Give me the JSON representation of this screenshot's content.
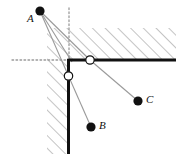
{
  "figure": {
    "kind": "optics-reflection-diagram",
    "width": 176,
    "height": 154,
    "background": "#ffffff"
  },
  "colors": {
    "wall": "#111111",
    "hatch": "#8a8a8a",
    "ray": "#9a9a9a",
    "dotted": "#9a9a9a",
    "point_fill": "#111111",
    "circle_fill": "#ffffff",
    "circle_stroke": "#111111",
    "label": "#111111"
  },
  "geometry": {
    "corner": {
      "x": 68.5,
      "y": 60
    },
    "horizontal_wall": {
      "x1": 68.5,
      "y1": 60,
      "x2": 176,
      "y2": 60,
      "width": 3
    },
    "vertical_wall": {
      "x1": 68.5,
      "y1": 60,
      "x2": 68.5,
      "y2": 154,
      "width": 3
    },
    "dotted_horizontal": {
      "x1": 12,
      "y1": 60,
      "x2": 68.5,
      "y2": 60
    },
    "dotted_vertical": {
      "x1": 69,
      "y1": 8,
      "x2": 69,
      "y2": 60
    }
  },
  "points": [
    {
      "name": "A",
      "label": "A",
      "x": 40,
      "y": 11,
      "r": 4.6,
      "label_x": 27,
      "label_y": 13,
      "type": "filled"
    },
    {
      "name": "B",
      "label": "B",
      "x": 91,
      "y": 127,
      "r": 4.6,
      "label_x": 99,
      "label_y": 120,
      "type": "filled"
    },
    {
      "name": "C",
      "label": "C",
      "x": 138,
      "y": 101,
      "r": 4.6,
      "label_x": 146,
      "label_y": 94,
      "type": "filled"
    }
  ],
  "contact_points": [
    {
      "name": "top-reflection-point",
      "x": 90,
      "y": 60,
      "r": 4.2,
      "type": "open"
    },
    {
      "name": "side-reflection-point",
      "x": 68.5,
      "y": 76,
      "r": 4.2,
      "type": "open"
    }
  ],
  "rays": [
    {
      "name": "ray-a-to-side-point",
      "x1": 40,
      "y1": 11,
      "x2": 68.5,
      "y2": 76
    },
    {
      "name": "ray-a-to-top-point",
      "x1": 40,
      "y1": 11,
      "x2": 90,
      "y2": 60
    },
    {
      "name": "ray-a-to-corner",
      "x1": 40,
      "y1": 11,
      "x2": 72,
      "y2": 62
    },
    {
      "name": "ray-top-point-to-c",
      "x1": 90,
      "y1": 60,
      "x2": 138,
      "y2": 101
    },
    {
      "name": "ray-side-point-to-b",
      "x1": 68.5,
      "y1": 76,
      "x2": 91,
      "y2": 127
    }
  ],
  "hatching": {
    "angle_deg": 45,
    "spacing": 9,
    "stroke_width": 1,
    "regions": [
      {
        "name": "upper-solid-region",
        "x": 68.5,
        "y": 28,
        "w": 107.5,
        "h": 32
      },
      {
        "name": "left-solid-region",
        "x": 47,
        "y": 60,
        "w": 21.5,
        "h": 94
      },
      {
        "name": "corner-solid-region",
        "x": 47,
        "y": 28,
        "w": 21.5,
        "h": 32
      }
    ]
  }
}
